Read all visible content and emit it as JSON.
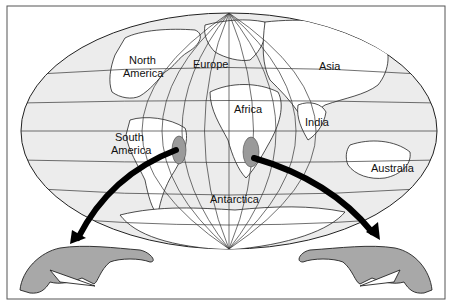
{
  "figure": {
    "type": "world map with fossil distribution",
    "colors": {
      "ocean": "#ececec",
      "land": "#ffffff",
      "fossil_region": "#9a9a9a",
      "animal": "#a8a8a8",
      "arrow": "#000000",
      "grid": "#333333"
    }
  },
  "labels": {
    "north_america": [
      "North",
      "America"
    ],
    "europe": "Europe",
    "asia": "Asia",
    "africa": "Africa",
    "india": "India",
    "south_america": [
      "South",
      "America"
    ],
    "australia": "Australia",
    "antarctica": "Antarctica"
  },
  "fossil_regions": [
    {
      "name": "South America fossil region"
    },
    {
      "name": "Africa fossil region"
    }
  ],
  "arrows": [
    {
      "from": "South America fossil region",
      "to": "left animal"
    },
    {
      "from": "Africa fossil region",
      "to": "right animal"
    }
  ]
}
